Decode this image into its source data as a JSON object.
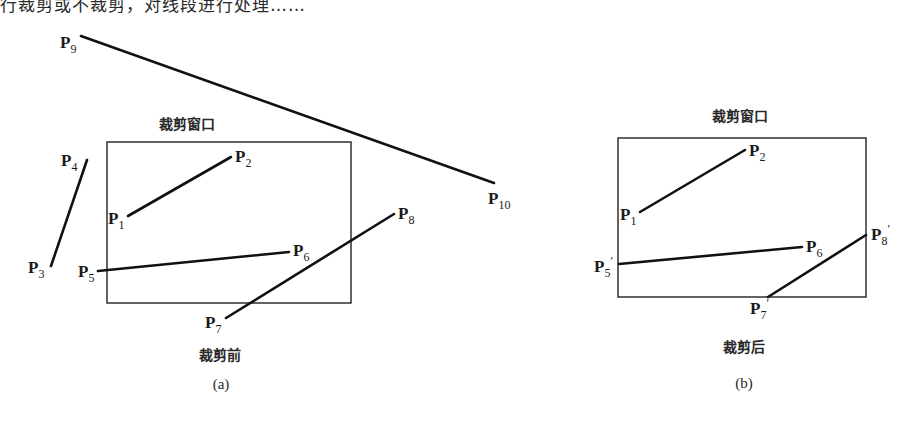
{
  "top_text": "行裁剪或不裁剪，对线段进行处理……",
  "panel_a": {
    "window_label": "裁剪窗口",
    "state_label": "裁剪前",
    "caption": "(a)",
    "window_rect": {
      "x1": 107,
      "y1": 142,
      "x2": 351,
      "y2": 303
    },
    "points": [
      {
        "name": "P",
        "sub": "1",
        "x": 128,
        "y": 216
      },
      {
        "name": "P",
        "sub": "2",
        "x": 231,
        "y": 157
      },
      {
        "name": "P",
        "sub": "3",
        "x": 51,
        "y": 266
      },
      {
        "name": "P",
        "sub": "4",
        "x": 87,
        "y": 160
      },
      {
        "name": "P",
        "sub": "5",
        "x": 98,
        "y": 271
      },
      {
        "name": "P",
        "sub": "6",
        "x": 289,
        "y": 252
      },
      {
        "name": "P",
        "sub": "7",
        "x": 226,
        "y": 318
      },
      {
        "name": "P",
        "sub": "8",
        "x": 394,
        "y": 214
      },
      {
        "name": "P",
        "sub": "9",
        "x": 81,
        "y": 36
      },
      {
        "name": "P",
        "sub": "10",
        "x": 494,
        "y": 183
      }
    ],
    "segments": [
      [
        "P1",
        "P2"
      ],
      [
        "P3",
        "P4"
      ],
      [
        "P5",
        "P6"
      ],
      [
        "P7",
        "P8"
      ],
      [
        "P9",
        "P10"
      ]
    ]
  },
  "panel_b": {
    "window_label": "裁剪窗口",
    "state_label": "裁剪后",
    "caption": "(b)",
    "window_rect": {
      "x1": 618,
      "y1": 138,
      "x2": 866,
      "y2": 297
    },
    "points": [
      {
        "name": "P",
        "sub": "1",
        "prime": false,
        "x": 640,
        "y": 212
      },
      {
        "name": "P",
        "sub": "2",
        "prime": false,
        "x": 745,
        "y": 150
      },
      {
        "name": "P",
        "sub": "5",
        "prime": true,
        "x": 619,
        "y": 264
      },
      {
        "name": "P",
        "sub": "6",
        "prime": false,
        "x": 802,
        "y": 247
      },
      {
        "name": "P",
        "sub": "7",
        "prime": true,
        "x": 768,
        "y": 297
      },
      {
        "name": "P",
        "sub": "8",
        "prime": true,
        "x": 866,
        "y": 235
      }
    ],
    "segments": [
      [
        "P1",
        "P2"
      ],
      [
        "P5'",
        "P6"
      ],
      [
        "P7'",
        "P8'"
      ]
    ]
  }
}
